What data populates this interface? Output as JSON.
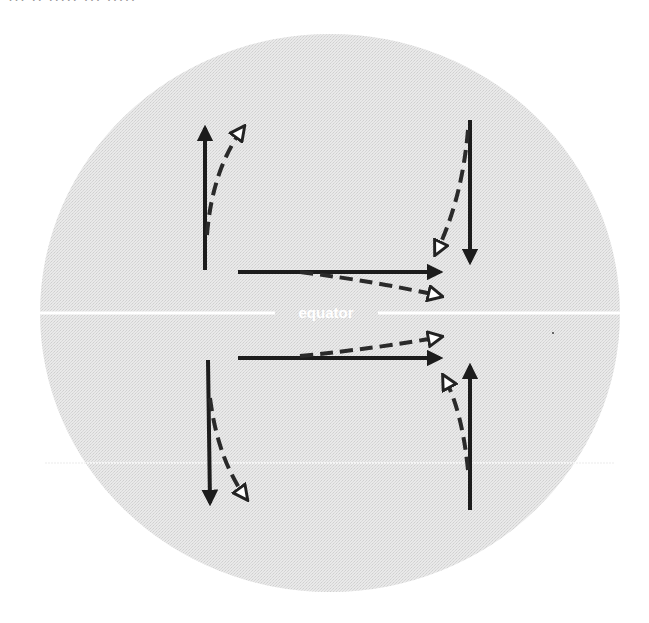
{
  "diagram": {
    "type": "coriolis-deflection",
    "top_caption_cut": "··· ·· ····· ··· ·····",
    "globe": {
      "cx": 330,
      "cy": 313,
      "rx": 290,
      "ry": 279,
      "fill": "#e6e6e6",
      "edge": "#f2f2f2"
    },
    "equator": {
      "label": "equator",
      "y": 313,
      "color": "#ffffff"
    },
    "latitude_line": {
      "y": 463,
      "color": "#f4f4f4"
    },
    "colors": {
      "solid_arrow": "#1c1c1c",
      "dashed_arrow": "#2a2a2a",
      "hollow_head_fill": "#ffffff"
    },
    "legend_meaning": {
      "solid": "intended path",
      "dashed": "deflected path"
    },
    "arrows": [
      {
        "id": "nw",
        "hemisphere": "north",
        "direction": "north",
        "solid": [
          205,
          270,
          205,
          128
        ],
        "dashed_path": "M207 235 Q212 170 243 128"
      },
      {
        "id": "ne",
        "hemisphere": "north",
        "direction": "south",
        "solid": [
          470,
          120,
          470,
          262
        ],
        "dashed_path": "M468 130 Q462 200 436 253"
      },
      {
        "id": "n-east",
        "hemisphere": "north",
        "direction": "east",
        "solid": [
          238,
          272,
          440,
          272
        ],
        "dashed_path": "M300 272 Q380 282 440 296"
      },
      {
        "id": "s-east",
        "hemisphere": "south",
        "direction": "east",
        "solid": [
          238,
          358,
          440,
          358
        ],
        "dashed_path": "M300 356 Q380 348 440 337"
      },
      {
        "id": "sw",
        "hemisphere": "south",
        "direction": "south",
        "solid": [
          208,
          360,
          210,
          503
        ],
        "dashed_path": "M210 398 Q218 460 246 498"
      },
      {
        "id": "se",
        "hemisphere": "south",
        "direction": "north",
        "solid": [
          470,
          510,
          470,
          366
        ],
        "dashed_path": "M468 470 Q462 410 444 377"
      }
    ]
  }
}
